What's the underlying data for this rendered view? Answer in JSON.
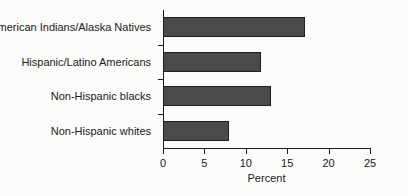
{
  "chart_data": {
    "type": "bar",
    "orientation": "horizontal",
    "title": "",
    "xlabel": "Percent",
    "ylabel": "",
    "xlim": [
      0,
      25
    ],
    "xticks": [
      0,
      5,
      10,
      15,
      20,
      25
    ],
    "xtick_labels": [
      "0",
      "5",
      "10",
      "15",
      "20",
      "25"
    ],
    "grid": false,
    "legend": null,
    "bar_color": "#4a4a4a",
    "bar_edge_color": "#1f1f1f",
    "categories": [
      "American Indians/Alaska Natives",
      "Hispanic/Latino Americans",
      "Non-Hispanic blacks",
      "Non-Hispanic whites"
    ],
    "values": [
      17.1,
      11.8,
      13.0,
      8.0
    ]
  }
}
